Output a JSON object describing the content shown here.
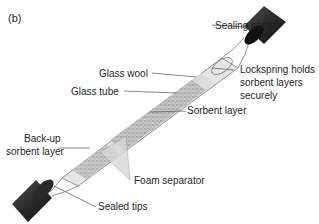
{
  "figure": {
    "panel_label": "(b)"
  },
  "labels": {
    "sealing_caps": "Sealing caps",
    "glass_wool": "Glass wool",
    "glass_tube": "Glass tube",
    "lockspring_1": "Lockspring holds",
    "lockspring_2": "sorbent layers",
    "lockspring_3": "securely",
    "sorbent_layer": "Sorbent layer",
    "backup_1": "Back-up",
    "backup_2": "sorbent layer",
    "foam_separator": "Foam separator",
    "sealed_tips": "Sealed tips"
  },
  "colors": {
    "cap": "#2b2b2b",
    "tube": "#cfcfcf",
    "sorbent": "#a8a8a8",
    "leader": "#555555"
  }
}
